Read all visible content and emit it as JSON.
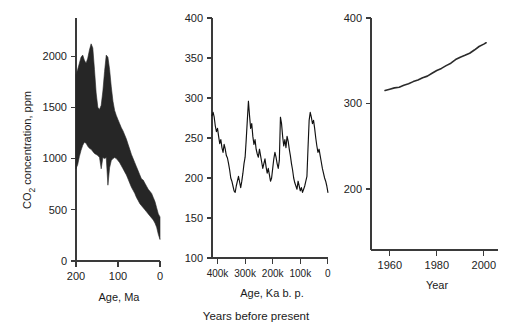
{
  "figure": {
    "caption": "Years before present",
    "shared_ylabel": "CO2 concentration, ppm",
    "shared_ylabel_main": "CO",
    "shared_ylabel_sub": "2",
    "shared_ylabel_rest": " concentration, ppm"
  },
  "chart_data": [
    {
      "type": "area",
      "panel": "left",
      "title": "",
      "xlabel": "Age, Ma",
      "ylabel": "CO2 concentration, ppm",
      "xlim": [
        200,
        0
      ],
      "ylim": [
        0,
        2300
      ],
      "xticks": [
        200,
        100,
        0
      ],
      "xticklabels": [
        "200",
        "100",
        "0"
      ],
      "yticks": [
        0,
        500,
        1000,
        1500,
        2000
      ],
      "yticklabels": [
        "0",
        "500",
        "1000",
        "1500",
        "2000"
      ],
      "grid": false,
      "legend": null,
      "description": "Phanerozoic GEOCARB-style CO2 uncertainty envelope over the last 200 million years",
      "x": [
        200,
        196,
        192,
        188,
        184,
        180,
        176,
        172,
        168,
        164,
        160,
        156,
        152,
        148,
        144,
        140,
        136,
        132,
        128,
        124,
        120,
        116,
        112,
        108,
        104,
        100,
        96,
        92,
        88,
        84,
        80,
        76,
        72,
        68,
        64,
        60,
        56,
        52,
        48,
        44,
        40,
        36,
        32,
        28,
        24,
        20,
        16,
        12,
        8,
        4,
        0
      ],
      "upper": [
        1820,
        1870,
        1930,
        1990,
        2010,
        1960,
        1930,
        1980,
        2060,
        2120,
        2080,
        1870,
        1640,
        1500,
        1480,
        1520,
        1660,
        1850,
        2010,
        1990,
        1870,
        1700,
        1560,
        1470,
        1420,
        1380,
        1340,
        1300,
        1270,
        1230,
        1190,
        1140,
        1090,
        1040,
        1000,
        960,
        920,
        880,
        840,
        800,
        790,
        760,
        730,
        700,
        680,
        660,
        620,
        580,
        520,
        460,
        430
      ],
      "lower": [
        900,
        940,
        1020,
        1080,
        1130,
        1160,
        1150,
        1120,
        1100,
        1090,
        1070,
        1050,
        1040,
        1030,
        1010,
        900,
        1010,
        1000,
        1010,
        740,
        910,
        980,
        1000,
        1010,
        1000,
        980,
        960,
        930,
        900,
        870,
        840,
        800,
        760,
        720,
        690,
        660,
        620,
        590,
        560,
        540,
        520,
        500,
        480,
        460,
        440,
        420,
        400,
        370,
        330,
        260,
        210
      ]
    },
    {
      "type": "line",
      "panel": "middle",
      "title": "",
      "xlabel": "Age, Ka b. p.",
      "ylabel": "CO2 concentration, ppm",
      "xlim": [
        420,
        0
      ],
      "ylim": [
        100,
        400
      ],
      "xticks": [
        400,
        300,
        200,
        100,
        0
      ],
      "xticklabels": [
        "400k",
        "300k",
        "200k",
        "100k",
        "0"
      ],
      "yticks": [
        100,
        150,
        200,
        250,
        300,
        350,
        400
      ],
      "yticklabels": [
        "100",
        "150",
        "200",
        "250",
        "300",
        "350",
        "400"
      ],
      "grid": false,
      "legend": null,
      "description": "Vostok ice core CO2 record over the last 420,000 years showing glacial-interglacial cycles",
      "x": [
        420,
        416,
        412,
        408,
        404,
        400,
        396,
        392,
        388,
        384,
        380,
        376,
        372,
        368,
        364,
        360,
        356,
        352,
        348,
        344,
        340,
        336,
        332,
        328,
        324,
        320,
        316,
        312,
        308,
        304,
        300,
        296,
        292,
        288,
        284,
        280,
        276,
        272,
        268,
        264,
        260,
        256,
        252,
        248,
        244,
        240,
        236,
        232,
        228,
        224,
        220,
        216,
        212,
        208,
        204,
        200,
        196,
        192,
        188,
        184,
        180,
        176,
        172,
        168,
        164,
        160,
        156,
        152,
        148,
        144,
        140,
        136,
        132,
        128,
        124,
        120,
        116,
        112,
        108,
        104,
        100,
        96,
        92,
        88,
        84,
        80,
        76,
        72,
        68,
        64,
        60,
        56,
        52,
        48,
        44,
        40,
        36,
        32,
        28,
        24,
        20,
        16,
        12,
        8,
        4,
        2,
        0
      ],
      "y": [
        278,
        282,
        276,
        265,
        258,
        262,
        252,
        243,
        248,
        238,
        232,
        242,
        236,
        228,
        225,
        218,
        210,
        200,
        196,
        190,
        184,
        182,
        190,
        196,
        202,
        195,
        188,
        196,
        206,
        218,
        226,
        248,
        272,
        296,
        278,
        262,
        268,
        252,
        242,
        248,
        236,
        230,
        226,
        236,
        228,
        220,
        212,
        218,
        224,
        214,
        206,
        212,
        204,
        196,
        200,
        212,
        224,
        232,
        226,
        218,
        212,
        222,
        276,
        268,
        252,
        240,
        248,
        238,
        252,
        246,
        236,
        228,
        218,
        210,
        200,
        194,
        190,
        186,
        196,
        190,
        184,
        188,
        182,
        186,
        190,
        196,
        202,
        238,
        272,
        282,
        276,
        268,
        272,
        262,
        250,
        240,
        232,
        236,
        228,
        220,
        212,
        206,
        200,
        196,
        190,
        186,
        182,
        188,
        196,
        202,
        192,
        186,
        190,
        200,
        208,
        202,
        196,
        190,
        186,
        192,
        200,
        208,
        216,
        224,
        240,
        262,
        280,
        268,
        250,
        252,
        258,
        272,
        282
      ]
    },
    {
      "type": "line",
      "panel": "right",
      "title": "",
      "xlabel": "Year",
      "ylabel": "CO2 concentration, ppm",
      "xlim": [
        1953,
        2003
      ],
      "ylim": [
        140,
        400
      ],
      "xticks": [
        1960,
        1980,
        2000
      ],
      "xticklabels": [
        "1960",
        "1980",
        "2000"
      ],
      "yticks": [
        200,
        300,
        400
      ],
      "yticklabels": [
        "200",
        "300",
        "400"
      ],
      "grid": false,
      "legend": null,
      "description": "Mauna Loa Keeling curve: modern instrumental CO2 record 1958-2001",
      "x": [
        1958,
        1960,
        1962,
        1964,
        1966,
        1968,
        1970,
        1972,
        1974,
        1976,
        1978,
        1980,
        1982,
        1984,
        1986,
        1988,
        1990,
        1992,
        1994,
        1996,
        1998,
        2000,
        2001
      ],
      "y": [
        315.3,
        316.9,
        318.4,
        319.2,
        321.4,
        323.1,
        325.7,
        327.5,
        330.2,
        332.1,
        335.4,
        338.7,
        341.1,
        344.4,
        347.2,
        351.5,
        354.2,
        356.4,
        358.8,
        362.6,
        366.7,
        369.5,
        371.1
      ]
    }
  ]
}
